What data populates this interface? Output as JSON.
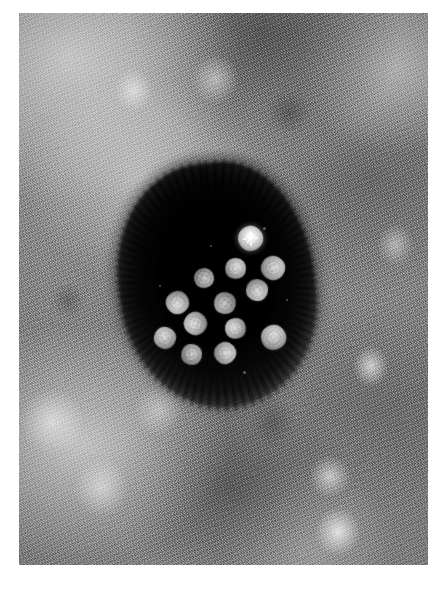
{
  "image": {
    "kind": "transmission-electron-micrograph",
    "technique": "negative stain",
    "subject": "icosahedral virus particles (virions) clustered in an electron-dense stain pool",
    "background_description": "granular, mottled grey cellular matrix with lighter and darker cloud-like regions",
    "plate": {
      "left": 19,
      "top": 13,
      "width": 409,
      "height": 552,
      "margin_color": "#ffffff"
    },
    "tones": {
      "plate_mid_grey": "#8a8a8a",
      "light_highlight": "#f2f2f2",
      "dark_matrix": "#3c3c3c",
      "stain_pool_black": "#050505",
      "virion_core": "#d4d4d4",
      "virion_rim": "#6e6e6e",
      "brightest_virion": "#ffffff"
    },
    "stain_pool": {
      "label": "electron-dense stain pool",
      "center_x": 198,
      "center_y": 272,
      "width": 196,
      "height": 245,
      "rotation_deg": -6,
      "edge_texture": "spiky / feathered stain fringe"
    },
    "particle_count": 13,
    "particle_diameter_px": 22,
    "particles": [
      {
        "id": 1,
        "label": "virion-1",
        "x": 250,
        "y": 238,
        "d": 25,
        "brightness": "brightest",
        "note": "central starburst highlight"
      },
      {
        "id": 2,
        "label": "virion-2",
        "x": 235,
        "y": 268,
        "d": 21,
        "brightness": "normal",
        "note": ""
      },
      {
        "id": 3,
        "label": "virion-3",
        "x": 273,
        "y": 268,
        "d": 24,
        "brightness": "normal",
        "note": ""
      },
      {
        "id": 4,
        "label": "virion-4",
        "x": 204,
        "y": 278,
        "d": 20,
        "brightness": "dim",
        "note": ""
      },
      {
        "id": 5,
        "label": "virion-5",
        "x": 257,
        "y": 290,
        "d": 22,
        "brightness": "normal",
        "note": ""
      },
      {
        "id": 6,
        "label": "virion-6",
        "x": 177,
        "y": 302,
        "d": 23,
        "brightness": "normal",
        "note": ""
      },
      {
        "id": 7,
        "label": "virion-7",
        "x": 225,
        "y": 303,
        "d": 22,
        "brightness": "dim",
        "note": ""
      },
      {
        "id": 8,
        "label": "virion-8",
        "x": 195,
        "y": 323,
        "d": 23,
        "brightness": "normal",
        "note": ""
      },
      {
        "id": 9,
        "label": "virion-9",
        "x": 235,
        "y": 328,
        "d": 21,
        "brightness": "normal",
        "note": ""
      },
      {
        "id": 10,
        "label": "virion-10",
        "x": 165,
        "y": 338,
        "d": 22,
        "brightness": "normal",
        "note": ""
      },
      {
        "id": 11,
        "label": "virion-11",
        "x": 273,
        "y": 337,
        "d": 25,
        "brightness": "normal",
        "note": ""
      },
      {
        "id": 12,
        "label": "virion-12",
        "x": 191,
        "y": 354,
        "d": 21,
        "brightness": "dim",
        "note": ""
      },
      {
        "id": 13,
        "label": "virion-13",
        "x": 225,
        "y": 353,
        "d": 22,
        "brightness": "normal",
        "note": ""
      }
    ],
    "specks": [
      {
        "x": 264,
        "y": 228,
        "d": 3
      },
      {
        "x": 211,
        "y": 246,
        "d": 2
      },
      {
        "x": 287,
        "y": 300,
        "d": 2
      },
      {
        "x": 160,
        "y": 286,
        "d": 2
      },
      {
        "x": 244,
        "y": 372,
        "d": 3
      }
    ],
    "bright_features": [
      {
        "label": "cytoplasmic-blob-right-lower",
        "x": 327,
        "y": 540,
        "d": 22
      },
      {
        "label": "cytoplasmic-blob-right-mid",
        "x": 332,
        "y": 492,
        "d": 28
      },
      {
        "label": "cytoplasmic-blob-right-upper",
        "x": 370,
        "y": 365,
        "d": 20
      },
      {
        "label": "cytoplasmic-blob-left-lower",
        "x": 78,
        "y": 470,
        "d": 40
      }
    ]
  },
  "caption": {
    "marks": [
      "",
      "",
      "",
      ""
    ]
  }
}
